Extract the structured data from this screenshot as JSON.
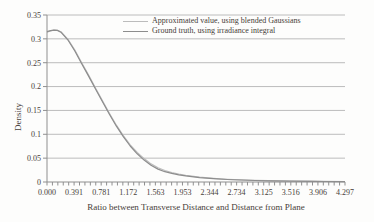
{
  "figure": {
    "background_color": "#fdfdfc",
    "text_color": "#474039"
  },
  "legend": {
    "entries": [
      {
        "id": "approximated",
        "label": "Approximated value, using blended Gaussians",
        "color": "#bcbcbc"
      },
      {
        "id": "ground-truth",
        "label": "Ground truth, using irradiance integral",
        "color": "#8d8d8d"
      }
    ]
  },
  "chart_data": {
    "type": "line",
    "title": "",
    "xlabel": "Ratio between Transverse Distance and Distance from Plane",
    "ylabel": "Density",
    "xlim": [
      0,
      4.297
    ],
    "ylim": [
      0,
      0.35
    ],
    "grid": "horizontal",
    "legend_position": "top-center-inside",
    "colors": {
      "grid": "#bcbcbc",
      "axis": "#8f8f8f",
      "tick": "#8f8f8f"
    },
    "x_ticks": [
      {
        "value": 0.0,
        "label": "0.000"
      },
      {
        "value": 0.391,
        "label": "0.391"
      },
      {
        "value": 0.781,
        "label": "0.781"
      },
      {
        "value": 1.172,
        "label": "1.172"
      },
      {
        "value": 1.563,
        "label": "1.563"
      },
      {
        "value": 1.953,
        "label": "1.953"
      },
      {
        "value": 2.344,
        "label": "2.344"
      },
      {
        "value": 2.734,
        "label": "2.734"
      },
      {
        "value": 3.125,
        "label": "3.125"
      },
      {
        "value": 3.516,
        "label": "3.516"
      },
      {
        "value": 3.906,
        "label": "3.906"
      },
      {
        "value": 4.297,
        "label": "4.297"
      }
    ],
    "x_minor_tick_count": 55,
    "y_ticks": [
      {
        "value": 0.35,
        "label": "0.35"
      },
      {
        "value": 0.3,
        "label": "0.3"
      },
      {
        "value": 0.25,
        "label": "0.25"
      },
      {
        "value": 0.2,
        "label": "0.2"
      },
      {
        "value": 0.15,
        "label": "0.15"
      },
      {
        "value": 0.1,
        "label": "0.1"
      },
      {
        "value": 0.05,
        "label": "0.05"
      },
      {
        "value": 0.0,
        "label": "0"
      }
    ],
    "series": [
      {
        "id": "approximated",
        "name": "Approximated value, using blended Gaussians",
        "color": "#bcbcbc",
        "points": [
          [
            0.0,
            0.314
          ],
          [
            0.05,
            0.3165
          ],
          [
            0.1,
            0.3182
          ],
          [
            0.15,
            0.318
          ],
          [
            0.2,
            0.315
          ],
          [
            0.3,
            0.2995
          ],
          [
            0.4,
            0.277
          ],
          [
            0.5,
            0.25
          ],
          [
            0.6,
            0.224
          ],
          [
            0.7,
            0.197
          ],
          [
            0.8,
            0.17
          ],
          [
            0.9,
            0.144
          ],
          [
            1.0,
            0.119
          ],
          [
            1.1,
            0.097
          ],
          [
            1.2,
            0.078
          ],
          [
            1.3,
            0.062
          ],
          [
            1.4,
            0.049
          ],
          [
            1.5,
            0.038
          ],
          [
            1.6,
            0.03
          ],
          [
            1.7,
            0.024
          ],
          [
            1.8,
            0.02
          ],
          [
            1.9,
            0.0165
          ],
          [
            2.0,
            0.014
          ],
          [
            2.2,
            0.01
          ],
          [
            2.4,
            0.0075
          ],
          [
            2.6,
            0.0056
          ],
          [
            2.8,
            0.0045
          ],
          [
            3.0,
            0.0036
          ],
          [
            3.2,
            0.0029
          ],
          [
            3.5,
            0.0022
          ],
          [
            3.8,
            0.0016
          ],
          [
            4.0,
            0.0013
          ],
          [
            4.297,
            0.001
          ]
        ]
      },
      {
        "id": "ground-truth",
        "name": "Ground truth, using irradiance integral",
        "color": "#8d8d8d",
        "points": [
          [
            0.0,
            0.315
          ],
          [
            0.05,
            0.317
          ],
          [
            0.1,
            0.3183
          ],
          [
            0.15,
            0.3178
          ],
          [
            0.2,
            0.314
          ],
          [
            0.3,
            0.298
          ],
          [
            0.4,
            0.275
          ],
          [
            0.5,
            0.248
          ],
          [
            0.6,
            0.222
          ],
          [
            0.7,
            0.195
          ],
          [
            0.8,
            0.168
          ],
          [
            0.9,
            0.142
          ],
          [
            1.0,
            0.117
          ],
          [
            1.1,
            0.095
          ],
          [
            1.2,
            0.0754
          ],
          [
            1.3,
            0.059
          ],
          [
            1.4,
            0.046
          ],
          [
            1.5,
            0.035
          ],
          [
            1.6,
            0.027
          ],
          [
            1.7,
            0.0215
          ],
          [
            1.8,
            0.018
          ],
          [
            1.9,
            0.015
          ],
          [
            2.0,
            0.0127
          ],
          [
            2.2,
            0.0093
          ],
          [
            2.4,
            0.007
          ],
          [
            2.6,
            0.0053
          ],
          [
            2.8,
            0.0041
          ],
          [
            3.0,
            0.0032
          ],
          [
            3.2,
            0.0025
          ],
          [
            3.5,
            0.0018
          ],
          [
            3.8,
            0.0013
          ],
          [
            4.0,
            0.0011
          ],
          [
            4.297,
            0.0009
          ]
        ]
      }
    ]
  }
}
